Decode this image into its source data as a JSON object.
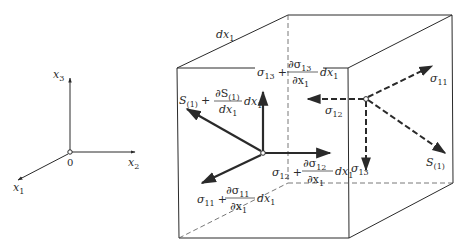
{
  "colors": {
    "line": "#2a2a2a",
    "background": "#ffffff"
  },
  "axes": {
    "origin_label": "0",
    "x1": {
      "base": "x",
      "sub": "1"
    },
    "x2": {
      "base": "x",
      "sub": "2"
    },
    "x3": {
      "base": "x",
      "sub": "3"
    }
  },
  "cube": {
    "edge_label": {
      "base": "dx",
      "sub": "1"
    }
  },
  "front_face": {
    "s_label": {
      "base": "S",
      "sub": "(1)",
      "plus": "+",
      "num": "∂S",
      "num_sub": "(1)",
      "den": "dx",
      "den_sub": "1",
      "tail": "dx",
      "tail_sub": "1"
    },
    "sigma13_label": {
      "base": "σ",
      "sub": "13",
      "plus": "+",
      "num": "∂σ",
      "num_sub": "13",
      "den": "∂x",
      "den_sub": "1",
      "tail": "dx",
      "tail_sub": "1"
    },
    "sigma12_label": {
      "base": "σ",
      "sub": "12",
      "plus": "+",
      "num": "∂σ",
      "num_sub": "12",
      "den": "∂x",
      "den_sub": "1",
      "tail": "dx",
      "tail_sub": "1"
    },
    "sigma11_label": {
      "base": "σ",
      "sub": "11",
      "plus": "+",
      "num": "∂σ",
      "num_sub": "11",
      "den": "∂x",
      "den_sub": "1",
      "tail": "dx",
      "tail_sub": "1"
    }
  },
  "back_face": {
    "sigma11": {
      "base": "σ",
      "sub": "11"
    },
    "sigma12": {
      "base": "σ",
      "sub": "12"
    },
    "sigma13": {
      "base": "σ",
      "sub": "13"
    },
    "s": {
      "base": "S",
      "sub": "(1)"
    }
  }
}
